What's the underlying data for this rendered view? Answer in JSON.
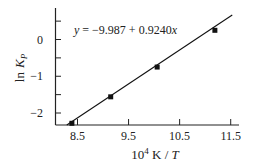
{
  "chart_data": {
    "type": "scatter",
    "title": "",
    "xlabel": "10^4 K / T",
    "xlabel_parts": {
      "base": "10",
      "sup": "4",
      "unit": " K / ",
      "var": "T"
    },
    "ylabel": "ln K_P",
    "ylabel_parts": {
      "fn": "ln",
      "var": "K",
      "sub": "P"
    },
    "xlim": [
      8.08,
      11.67
    ],
    "ylim": [
      -2.33,
      0.86
    ],
    "x_ticks": [
      8.5,
      9.5,
      10.5,
      11.5
    ],
    "x_tick_labels": [
      "8.5",
      "9.5",
      "10.5",
      "11.5"
    ],
    "x_minor_ticks": [],
    "y_ticks": [
      0.5,
      0,
      -0.5,
      -1,
      -1.5,
      -2
    ],
    "y_tick_labels": [
      "",
      "0",
      "",
      "−1",
      "",
      "−2"
    ],
    "grid": false,
    "legend": null,
    "series": [
      {
        "name": "data",
        "marker": "square",
        "color": "#111111",
        "x": [
          8.39,
          9.15,
          10.06,
          11.19
        ],
        "y": [
          -2.28,
          -1.56,
          -0.75,
          0.25
        ]
      }
    ],
    "fit_line": {
      "intercept": -9.987,
      "slope": 0.924,
      "x_range": [
        8.29,
        11.53
      ],
      "color": "#111111"
    },
    "annotations": [
      {
        "text": "y = −9.987 + 0.9240x",
        "x_px": 74,
        "y_px": 29
      }
    ]
  },
  "equation": {
    "y_var": "y",
    "eq_text": " = −9.987 + 0.9240",
    "x_var": "x"
  },
  "x_labels": [
    "8.5",
    "9.5",
    "10.5",
    "11.5"
  ],
  "y_labels": [
    "0",
    "−1",
    "−2"
  ]
}
